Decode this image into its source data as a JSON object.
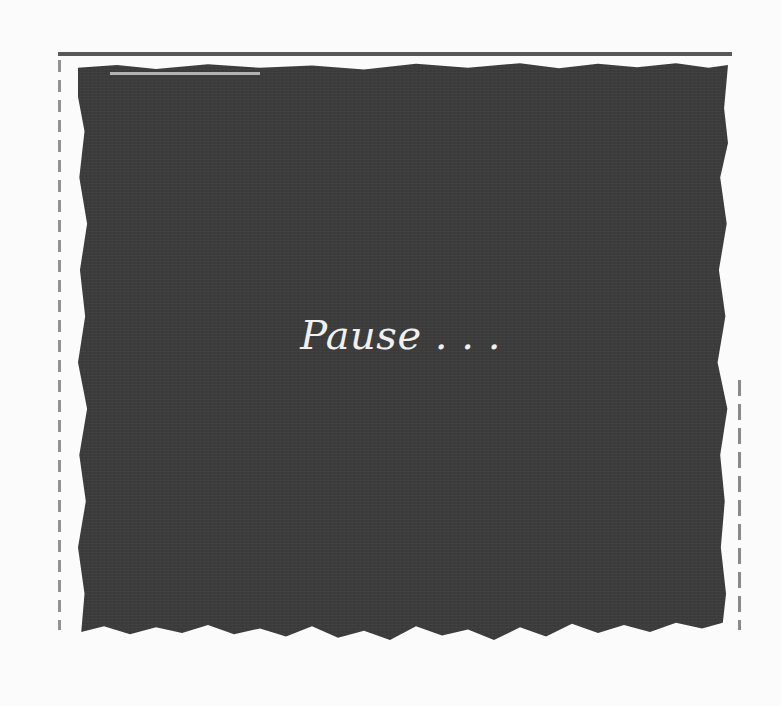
{
  "message": {
    "text": "Pause . . ."
  },
  "colors": {
    "background": "#fbfbfb",
    "panel": "#3c3c3c",
    "text": "#f0f0f0"
  }
}
